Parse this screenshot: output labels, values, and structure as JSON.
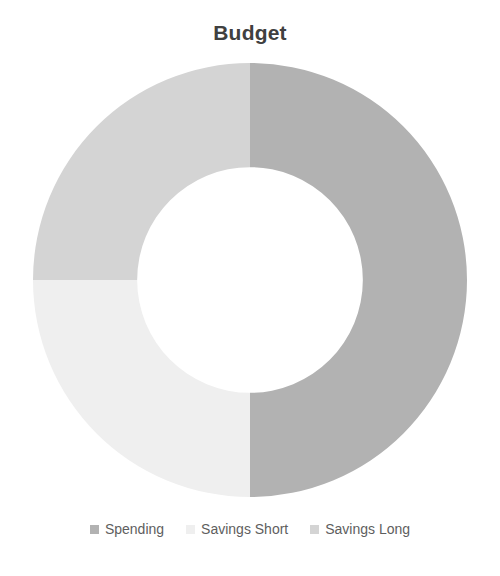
{
  "chart_data": {
    "type": "pie",
    "variant": "doughnut",
    "title": "Budget",
    "subtitle": "",
    "xlabel": "",
    "ylabel": "",
    "categories": [
      "Spending",
      "Savings Short",
      "Savings Long"
    ],
    "values": [
      50,
      25,
      25
    ],
    "value_unit": "percent",
    "labels_shown": false,
    "grid": false,
    "legend_position": "bottom",
    "start_angle_deg": 0,
    "direction": "clockwise",
    "hole_ratio": 0.52,
    "slices": [
      {
        "name": "Spending",
        "value": 50,
        "percent": "50%",
        "color": "#b2b2b2",
        "start_deg": 0,
        "end_deg": 180
      },
      {
        "name": "Savings Short",
        "value": 25,
        "percent": "25%",
        "color": "#efefef",
        "start_deg": 180,
        "end_deg": 270
      },
      {
        "name": "Savings Long",
        "value": 25,
        "percent": "25%",
        "color": "#d4d4d4",
        "start_deg": 270,
        "end_deg": 360
      }
    ]
  },
  "title": {
    "text": "Budget"
  },
  "legend": {
    "items": [
      {
        "label": "Spending",
        "color": "#b2b2b2"
      },
      {
        "label": "Savings Short",
        "color": "#efefef"
      },
      {
        "label": "Savings Long",
        "color": "#d4d4d4"
      }
    ]
  },
  "colors": {
    "title_text": "#404040",
    "legend_text": "#5e5e5e",
    "background": "#ffffff",
    "series_1": "#b2b2b2",
    "series_2": "#efefef",
    "series_3": "#d4d4d4"
  }
}
